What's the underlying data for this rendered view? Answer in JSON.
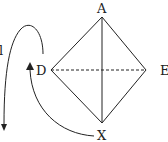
{
  "diagram": {
    "type": "square-pyramid-projection",
    "vertices": [
      {
        "id": "A",
        "label": "A",
        "x": 102,
        "y": 17
      },
      {
        "id": "D",
        "label": "D",
        "x": 51,
        "y": 70
      },
      {
        "id": "E",
        "label": "E",
        "x": 146,
        "y": 70
      },
      {
        "id": "X",
        "label": "X",
        "x": 102,
        "y": 123
      }
    ],
    "edges": [
      {
        "from": "A",
        "to": "D",
        "style": "solid"
      },
      {
        "from": "A",
        "to": "E",
        "style": "solid"
      },
      {
        "from": "D",
        "to": "X",
        "style": "solid"
      },
      {
        "from": "E",
        "to": "X",
        "style": "solid"
      },
      {
        "from": "A",
        "to": "X",
        "style": "solid"
      },
      {
        "from": "D",
        "to": "E",
        "style": "dashed"
      }
    ],
    "arrows": [
      {
        "name": "loop-arrow-down",
        "direction": "down"
      },
      {
        "name": "curved-arrow-x-to-d",
        "direction": "up"
      }
    ],
    "edge_label_partial": "l",
    "stroke_color": "#222222"
  }
}
